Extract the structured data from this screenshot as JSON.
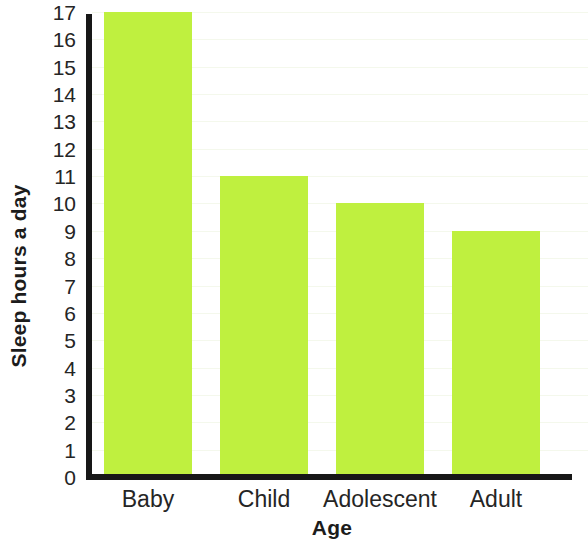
{
  "chart_data": {
    "type": "bar",
    "title": "",
    "title_fragment": "/",
    "categories": [
      "Baby",
      "Child",
      "Adolescent",
      "Adult"
    ],
    "values": [
      17,
      11,
      10,
      9
    ],
    "series": [
      {
        "name": "Sleep hours a day",
        "values": [
          17,
          11,
          10,
          9
        ]
      }
    ],
    "xlabel": "Age",
    "ylabel": "Sleep hours a day",
    "ylim": [
      0,
      17
    ],
    "ytick_labels": [
      "17",
      "16",
      "15",
      "14",
      "13",
      "12",
      "11",
      "10",
      "9",
      "8",
      "7",
      "6",
      "5",
      "4",
      "3",
      "2",
      "1",
      "0"
    ],
    "ytick_values": [
      17,
      16,
      15,
      14,
      13,
      12,
      11,
      10,
      9,
      8,
      7,
      6,
      5,
      4,
      3,
      2,
      1,
      0
    ],
    "grid": true,
    "legend": false,
    "legend_position": "none",
    "bar_color": "#bff03f",
    "axis_color": "#171717",
    "grid_color": "#f4f8ec",
    "background_color": "#ffffff"
  }
}
